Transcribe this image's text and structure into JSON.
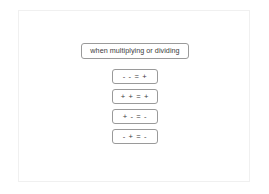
{
  "diagram": {
    "title_node": {
      "text": "when multiplying or dividing"
    },
    "rules": [
      {
        "text": "- - = +"
      },
      {
        "text": "+ + = +"
      },
      {
        "text": "+ - = -"
      },
      {
        "text": "- + = -"
      }
    ],
    "colors": {
      "node_border": "#9a9a9a",
      "node_fill": "#ffffff",
      "text": "#3b3b3b",
      "frame_border": "#f0f0f0",
      "background": "#ffffff"
    }
  }
}
